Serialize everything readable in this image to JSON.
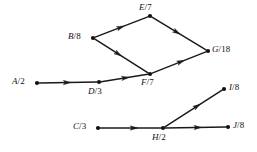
{
  "diagram": {
    "type": "directed-graph",
    "nodes": [
      {
        "id": "A",
        "label": "A/2",
        "name": "A",
        "weight": "2",
        "x": 37,
        "y": 83,
        "label_x": 12,
        "label_y": 77,
        "label_align": "left"
      },
      {
        "id": "B",
        "label": "B/8",
        "name": "B",
        "weight": "8",
        "x": 93,
        "y": 38,
        "label_x": 68,
        "label_y": 32,
        "label_align": "left"
      },
      {
        "id": "C",
        "label": "C/3",
        "name": "C",
        "weight": "3",
        "x": 98,
        "y": 128,
        "label_x": 73,
        "label_y": 122,
        "label_align": "left"
      },
      {
        "id": "D",
        "label": "D/3",
        "name": "D",
        "weight": "3",
        "x": 99,
        "y": 82,
        "label_x": 88,
        "label_y": 87,
        "label_align": "left"
      },
      {
        "id": "E",
        "label": "E/7",
        "name": "E",
        "weight": "7",
        "x": 150,
        "y": 16,
        "label_x": 139,
        "label_y": 3,
        "label_align": "left"
      },
      {
        "id": "F",
        "label": "F/7",
        "name": "F",
        "weight": "7",
        "x": 150,
        "y": 74,
        "label_x": 141,
        "label_y": 78,
        "label_align": "left"
      },
      {
        "id": "G",
        "label": "G/18",
        "name": "G",
        "weight": "18",
        "x": 208,
        "y": 51,
        "label_x": 212,
        "label_y": 45,
        "label_align": "left"
      },
      {
        "id": "H",
        "label": "H/2",
        "name": "H",
        "weight": "2",
        "x": 163,
        "y": 128,
        "label_x": 152,
        "label_y": 133,
        "label_align": "left"
      },
      {
        "id": "I",
        "label": "I/8",
        "name": "I",
        "weight": "8",
        "x": 224,
        "y": 89,
        "label_x": 229,
        "label_y": 83,
        "label_align": "left"
      },
      {
        "id": "J",
        "label": "J/8",
        "name": "J",
        "weight": "8",
        "x": 228,
        "y": 127,
        "label_x": 233,
        "label_y": 121,
        "label_align": "left"
      }
    ],
    "edges": [
      {
        "id": "A-D",
        "from": "A",
        "to": "D",
        "arrow_at": 0.55
      },
      {
        "id": "D-F",
        "from": "D",
        "to": "F",
        "arrow_at": 0.6
      },
      {
        "id": "B-E",
        "from": "B",
        "to": "E",
        "arrow_at": 0.55
      },
      {
        "id": "B-F",
        "from": "B",
        "to": "F",
        "arrow_at": 0.5
      },
      {
        "id": "E-G",
        "from": "E",
        "to": "G",
        "arrow_at": 0.52
      },
      {
        "id": "F-G",
        "from": "F",
        "to": "G",
        "arrow_at": 0.6
      },
      {
        "id": "C-H",
        "from": "C",
        "to": "H",
        "arrow_at": 0.62
      },
      {
        "id": "H-I",
        "from": "H",
        "to": "I",
        "arrow_at": 0.62
      },
      {
        "id": "H-J",
        "from": "H",
        "to": "J",
        "arrow_at": 0.6
      }
    ],
    "style": {
      "line_color": "#1a1a1a",
      "node_color": "#111111",
      "text_color": "#121212",
      "background": "#ffffff",
      "node_radius": 2.1,
      "arrow_length": 7.5,
      "arrow_width": 4.4
    }
  }
}
